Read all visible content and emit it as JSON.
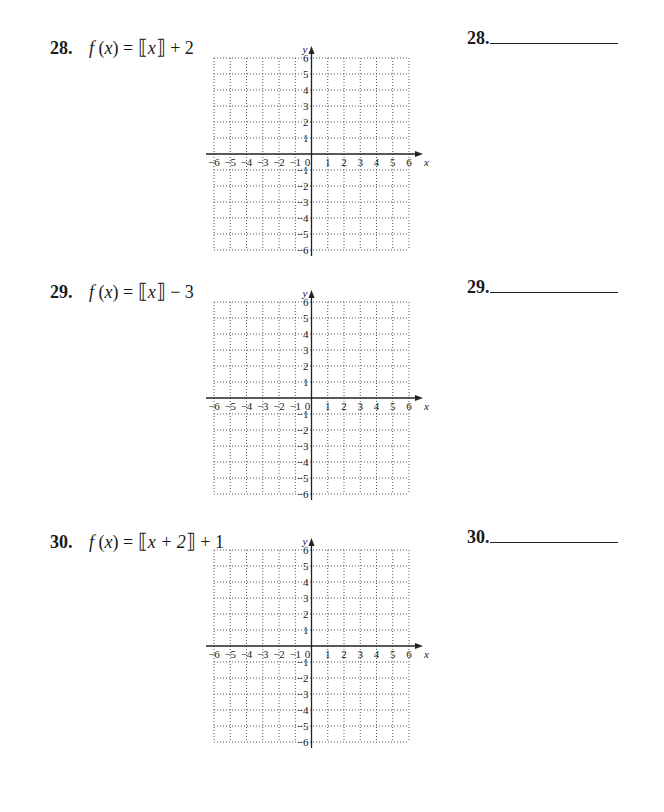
{
  "problems": [
    {
      "number": "28.",
      "function_name": "f",
      "variable": "x",
      "expression_prefix": "f (x) = ",
      "expression_inner": "x",
      "expression_suffix": " + 2",
      "full_expression": "f(x) = ⟦x⟧ + 2",
      "answer_label": "28.",
      "answer_value": ""
    },
    {
      "number": "29.",
      "function_name": "f",
      "variable": "x",
      "expression_prefix": "f (x) = ",
      "expression_inner": "x",
      "expression_suffix": " − 3",
      "full_expression": "f(x) = ⟦x⟧ − 3",
      "answer_label": "29.",
      "answer_value": ""
    },
    {
      "number": "30.",
      "function_name": "f",
      "variable": "x",
      "expression_prefix": "f (x) = ",
      "expression_inner": "x + 2",
      "expression_suffix": " + 1",
      "full_expression": "f(x) = ⟦x + 2⟧ + 1",
      "answer_label": "30.",
      "answer_value": ""
    }
  ],
  "grid": {
    "x_axis_label": "x",
    "y_axis_label": "y",
    "x_ticks": [
      "−6",
      "−5",
      "−4",
      "−3",
      "−2",
      "−1",
      "0",
      "1",
      "2",
      "3",
      "4",
      "5",
      "6"
    ],
    "y_ticks_positive": [
      "1",
      "2",
      "3",
      "4",
      "5",
      "6"
    ],
    "y_ticks_negative": [
      "−1",
      "−2",
      "−3",
      "−4",
      "−5",
      "−6"
    ],
    "xmin": -6,
    "xmax": 6,
    "ymin": -6,
    "ymax": 6,
    "grid_style": "dotted",
    "axis_color": "#222222",
    "grid_color": "#555555"
  }
}
